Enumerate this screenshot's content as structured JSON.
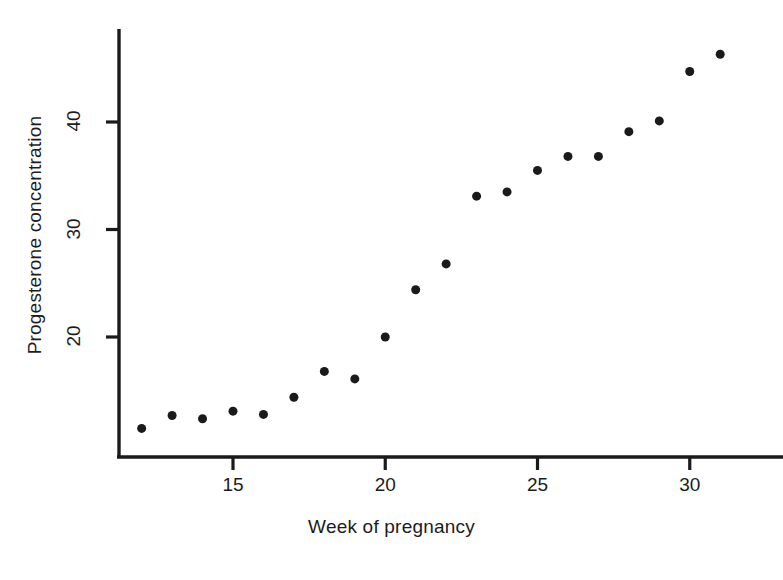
{
  "chart_data": {
    "type": "scatter",
    "title": "",
    "xlabel": "Week of pregnancy",
    "ylabel": "Progesterone concentration",
    "xlim": [
      11.2,
      32.0
    ],
    "ylim": [
      9.0,
      48.0
    ],
    "grid": false,
    "legend": null,
    "xticks": [
      15,
      20,
      25,
      30
    ],
    "yticks": [
      20,
      30,
      40
    ],
    "xtick_labels": [
      "15",
      "20",
      "25",
      "30"
    ],
    "ytick_labels": [
      "20",
      "30",
      "40"
    ],
    "marker": "filled-circle",
    "marker_color": "#1a1a1a",
    "marker_size": 9,
    "x": [
      12,
      13,
      14,
      15,
      16,
      17,
      18,
      19,
      20,
      21,
      22,
      23,
      24,
      25,
      26,
      27,
      28,
      29,
      30,
      31
    ],
    "y": [
      11.5,
      12.7,
      12.4,
      13.1,
      12.8,
      14.4,
      16.8,
      16.1,
      20.0,
      24.4,
      26.8,
      33.1,
      33.5,
      35.5,
      36.8,
      36.8,
      39.1,
      40.1,
      44.7,
      46.3
    ],
    "points": [
      {
        "x": 12,
        "y": 11.5
      },
      {
        "x": 13,
        "y": 12.7
      },
      {
        "x": 14,
        "y": 12.4
      },
      {
        "x": 15,
        "y": 13.1
      },
      {
        "x": 16,
        "y": 12.8
      },
      {
        "x": 17,
        "y": 14.4
      },
      {
        "x": 18,
        "y": 16.8
      },
      {
        "x": 19,
        "y": 16.1
      },
      {
        "x": 20,
        "y": 20.0
      },
      {
        "x": 21,
        "y": 24.4
      },
      {
        "x": 22,
        "y": 26.8
      },
      {
        "x": 23,
        "y": 33.1
      },
      {
        "x": 24,
        "y": 33.5
      },
      {
        "x": 25,
        "y": 35.5
      },
      {
        "x": 26,
        "y": 36.8
      },
      {
        "x": 27,
        "y": 36.8
      },
      {
        "x": 28,
        "y": 39.1
      },
      {
        "x": 29,
        "y": 40.1
      },
      {
        "x": 30,
        "y": 44.7
      },
      {
        "x": 31,
        "y": 46.3
      }
    ]
  },
  "axes": {
    "axis_color": "#1a1a1a",
    "axis_line_width": 3
  }
}
